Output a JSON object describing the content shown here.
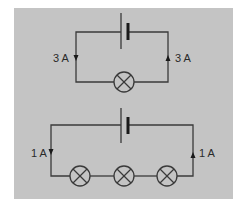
{
  "colors": {
    "panel_bg": "#c4c4c4",
    "wire": "#3a3a3a",
    "page_bg": "#ffffff"
  },
  "circuits": [
    {
      "name": "single-lamp-circuit",
      "cell": "battery",
      "lamps": 1,
      "current_left": "3 A",
      "current_right": "3 A"
    },
    {
      "name": "three-lamp-series-circuit",
      "cell": "battery",
      "lamps": 3,
      "current_left": "1 A",
      "current_right": "1 A"
    }
  ]
}
